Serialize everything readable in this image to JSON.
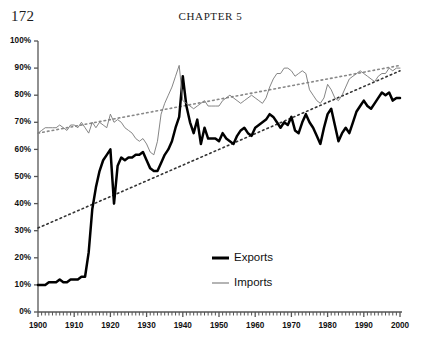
{
  "page": {
    "page_number": "172",
    "chapter_header": "CHAPTER 5"
  },
  "colors": {
    "exports": "#000000",
    "imports": "#777777",
    "axis": "#555555",
    "text": "#111111",
    "background": "#ffffff"
  },
  "chart_data": {
    "type": "line",
    "title": "",
    "xlabel": "",
    "ylabel": "",
    "xlim": [
      1900,
      2000
    ],
    "ylim": [
      0,
      100
    ],
    "grid": false,
    "legend_position": "inside-bottom-center",
    "y_ticks": [
      "0%",
      "10%",
      "20%",
      "30%",
      "40%",
      "50%",
      "60%",
      "70%",
      "80%",
      "90%",
      "100%"
    ],
    "y_tick_values": [
      0,
      10,
      20,
      30,
      40,
      50,
      60,
      70,
      80,
      90,
      100
    ],
    "x_ticks": [
      "1900",
      "1910",
      "1920",
      "1930",
      "1940",
      "1950",
      "1960",
      "1970",
      "1980",
      "1990",
      "2000"
    ],
    "x_tick_values": [
      1900,
      1910,
      1920,
      1930,
      1940,
      1950,
      1960,
      1970,
      1980,
      1990,
      2000
    ],
    "x_minor_tick_step": 1,
    "series": [
      {
        "name": "Exports",
        "style": "solid-thick",
        "color": "#000000",
        "x": [
          1900,
          1901,
          1902,
          1903,
          1904,
          1905,
          1906,
          1907,
          1908,
          1909,
          1910,
          1911,
          1912,
          1913,
          1914,
          1915,
          1916,
          1917,
          1918,
          1919,
          1920,
          1921,
          1922,
          1923,
          1924,
          1925,
          1926,
          1927,
          1928,
          1929,
          1930,
          1931,
          1932,
          1933,
          1934,
          1935,
          1936,
          1937,
          1938,
          1939,
          1940,
          1941,
          1942,
          1943,
          1944,
          1945,
          1946,
          1947,
          1948,
          1949,
          1950,
          1951,
          1952,
          1953,
          1954,
          1955,
          1956,
          1957,
          1958,
          1959,
          1960,
          1961,
          1962,
          1963,
          1964,
          1965,
          1966,
          1967,
          1968,
          1969,
          1970,
          1971,
          1972,
          1973,
          1974,
          1975,
          1976,
          1977,
          1978,
          1979,
          1980,
          1981,
          1982,
          1983,
          1984,
          1985,
          1986,
          1987,
          1988,
          1989,
          1990,
          1991,
          1992,
          1993,
          1994,
          1995,
          1996,
          1997,
          1998,
          1999,
          2000
        ],
        "y": [
          10,
          10,
          10,
          11,
          11,
          11,
          12,
          11,
          11,
          12,
          12,
          12,
          13,
          13,
          22,
          38,
          46,
          52,
          56,
          58,
          60,
          40,
          54,
          57,
          56,
          57,
          57,
          58,
          58,
          59,
          56,
          53,
          52,
          52,
          55,
          58,
          60,
          63,
          68,
          72,
          87,
          76,
          70,
          66,
          71,
          62,
          68,
          64,
          64,
          64,
          63,
          66,
          64,
          63,
          62,
          65,
          67,
          68,
          66,
          65,
          68,
          69,
          70,
          71,
          73,
          72,
          70,
          68,
          70,
          69,
          72,
          67,
          66,
          70,
          73,
          70,
          68,
          65,
          62,
          68,
          73,
          75,
          69,
          63,
          66,
          68,
          66,
          70,
          74,
          76,
          78,
          76,
          75,
          77,
          79,
          81,
          80,
          81,
          78,
          79,
          79
        ]
      },
      {
        "name": "Imports",
        "style": "solid-thin",
        "color": "#777777",
        "x": [
          1900,
          1901,
          1902,
          1903,
          1904,
          1905,
          1906,
          1907,
          1908,
          1909,
          1910,
          1911,
          1912,
          1913,
          1914,
          1915,
          1916,
          1917,
          1918,
          1919,
          1920,
          1921,
          1922,
          1923,
          1924,
          1925,
          1926,
          1927,
          1928,
          1929,
          1930,
          1931,
          1932,
          1933,
          1934,
          1935,
          1936,
          1937,
          1938,
          1939,
          1940,
          1941,
          1942,
          1943,
          1944,
          1945,
          1946,
          1947,
          1948,
          1949,
          1950,
          1951,
          1952,
          1953,
          1954,
          1955,
          1956,
          1957,
          1958,
          1959,
          1960,
          1961,
          1962,
          1963,
          1964,
          1965,
          1966,
          1967,
          1968,
          1969,
          1970,
          1971,
          1972,
          1973,
          1974,
          1975,
          1976,
          1977,
          1978,
          1979,
          1980,
          1981,
          1982,
          1983,
          1984,
          1985,
          1986,
          1987,
          1988,
          1989,
          1990,
          1991,
          1992,
          1993,
          1994,
          1995,
          1996,
          1997,
          1998,
          1999,
          2000
        ],
        "y": [
          66,
          67,
          68,
          68,
          68,
          68,
          69,
          68,
          67,
          69,
          69,
          68,
          70,
          68,
          66,
          70,
          68,
          70,
          69,
          68,
          73,
          70,
          71,
          70,
          68,
          67,
          66,
          64,
          63,
          64,
          62,
          59,
          58,
          63,
          73,
          77,
          80,
          83,
          87,
          91,
          78,
          77,
          76,
          75,
          76,
          77,
          78,
          76,
          76,
          76,
          76,
          78,
          79,
          80,
          79,
          78,
          77,
          78,
          79,
          80,
          79,
          78,
          77,
          79,
          83,
          86,
          88,
          88,
          90,
          90,
          89,
          87,
          88,
          89,
          88,
          82,
          80,
          78,
          77,
          79,
          84,
          82,
          79,
          78,
          80,
          83,
          86,
          87,
          88,
          89,
          88,
          87,
          86,
          85,
          87,
          88,
          88,
          90,
          89,
          90,
          90
        ]
      }
    ],
    "trendlines": [
      {
        "name": "Exports trend",
        "style": "dotted",
        "color": "#333333",
        "x": [
          1900,
          2000
        ],
        "y": [
          31,
          89
        ]
      },
      {
        "name": "Imports trend",
        "style": "dotted",
        "color": "#888888",
        "x": [
          1900,
          2000
        ],
        "y": [
          66,
          91
        ]
      }
    ],
    "legend": [
      {
        "label": "Exports",
        "style": "solid-thick",
        "color": "#000000"
      },
      {
        "label": "Imports",
        "style": "solid-thin",
        "color": "#777777"
      }
    ]
  }
}
